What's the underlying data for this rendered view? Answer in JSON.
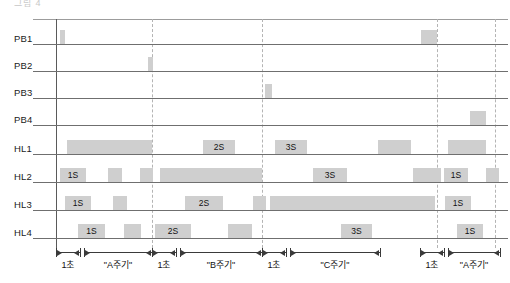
{
  "title_clipped": "그림 4",
  "rows": [
    {
      "id": "PB1",
      "label": "PB1",
      "y": 30
    },
    {
      "id": "PB2",
      "label": "PB2",
      "y": 57
    },
    {
      "id": "PB3",
      "label": "PB3",
      "y": 84
    },
    {
      "id": "PB4",
      "label": "PB4",
      "y": 111
    },
    {
      "id": "HL1",
      "label": "HL1",
      "y": 140
    },
    {
      "id": "HL2",
      "label": "HL2",
      "y": 168
    },
    {
      "id": "HL3",
      "label": "HL3",
      "y": 196
    },
    {
      "id": "HL4",
      "label": "HL4",
      "y": 224
    }
  ],
  "colors": {
    "bar": "#cfcfcf",
    "baseline": "#6f6f6f",
    "dashed": "#b4b4b4",
    "axis": "#3a3a3a",
    "text": "#111111"
  },
  "plot": {
    "left": 56,
    "right": 508,
    "row_height": 27,
    "bar_height": 14
  },
  "dashed_lines": [
    152,
    262,
    437,
    495
  ],
  "bars": {
    "PB1": [
      {
        "x": 60,
        "w": 5,
        "label": ""
      },
      {
        "x": 421,
        "w": 16,
        "label": ""
      }
    ],
    "PB2": [
      {
        "x": 148,
        "w": 5,
        "label": ""
      }
    ],
    "PB3": [
      {
        "x": 265,
        "w": 7,
        "label": ""
      }
    ],
    "PB4": [
      {
        "x": 470,
        "w": 16,
        "label": ""
      }
    ],
    "HL1": [
      {
        "x": 67,
        "w": 85,
        "label": ""
      },
      {
        "x": 203,
        "w": 32,
        "label": "2S"
      },
      {
        "x": 275,
        "w": 32,
        "label": "3S"
      },
      {
        "x": 378,
        "w": 33,
        "label": ""
      },
      {
        "x": 448,
        "w": 38,
        "label": ""
      }
    ],
    "HL2": [
      {
        "x": 60,
        "w": 26,
        "label": "1S"
      },
      {
        "x": 108,
        "w": 14,
        "label": ""
      },
      {
        "x": 140,
        "w": 13,
        "label": ""
      },
      {
        "x": 160,
        "w": 102,
        "label": ""
      },
      {
        "x": 313,
        "w": 34,
        "label": "3S"
      },
      {
        "x": 413,
        "w": 28,
        "label": ""
      },
      {
        "x": 444,
        "w": 24,
        "label": "1S"
      },
      {
        "x": 486,
        "w": 13,
        "label": ""
      }
    ],
    "HL3": [
      {
        "x": 65,
        "w": 26,
        "label": "1S"
      },
      {
        "x": 113,
        "w": 14,
        "label": ""
      },
      {
        "x": 185,
        "w": 38,
        "label": "2S"
      },
      {
        "x": 253,
        "w": 13,
        "label": ""
      },
      {
        "x": 270,
        "w": 165,
        "label": ""
      },
      {
        "x": 445,
        "w": 26,
        "label": "1S"
      }
    ],
    "HL4": [
      {
        "x": 78,
        "w": 27,
        "label": "1S"
      },
      {
        "x": 124,
        "w": 17,
        "label": ""
      },
      {
        "x": 155,
        "w": 36,
        "label": "2S"
      },
      {
        "x": 228,
        "w": 24,
        "label": ""
      },
      {
        "x": 341,
        "w": 31,
        "label": "3S"
      },
      {
        "x": 457,
        "w": 26,
        "label": "1S"
      }
    ]
  },
  "axis_spans": [
    {
      "id": "a1",
      "x1": 56,
      "x2": 80,
      "caption": "1초",
      "type": "double"
    },
    {
      "id": "a2",
      "x1": 84,
      "x2": 152,
      "caption": "\"A주기\"",
      "type": "double"
    },
    {
      "id": "b1",
      "x1": 152,
      "x2": 176,
      "caption": "1초",
      "type": "double"
    },
    {
      "id": "b2",
      "x1": 180,
      "x2": 262,
      "caption": "\"B주기\"",
      "type": "double"
    },
    {
      "id": "c1",
      "x1": 262,
      "x2": 286,
      "caption": "1초",
      "type": "double"
    },
    {
      "id": "c2",
      "x1": 290,
      "x2": 380,
      "caption": "\"C주기\"",
      "type": "double"
    },
    {
      "id": "d1",
      "x1": 420,
      "x2": 444,
      "caption": "1초",
      "type": "double"
    },
    {
      "id": "d2",
      "x1": 448,
      "x2": 500,
      "caption": "\"A주기\"",
      "type": "double"
    }
  ]
}
